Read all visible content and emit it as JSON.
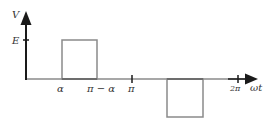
{
  "diagram": {
    "type": "waveform",
    "axes": {
      "y_label": "V",
      "x_label": "ωt",
      "y_tick_label": "E",
      "x_tick_labels": [
        "α",
        "π − α",
        "π",
        "2π"
      ]
    },
    "pulses": [
      {
        "name": "positive-pulse",
        "from": "α",
        "to": "π − α",
        "level": "E"
      },
      {
        "name": "negative-pulse",
        "from": "π + α",
        "to": "2π − α",
        "level": "−E"
      }
    ],
    "colors": {
      "axis": "#1a1a1a",
      "pulse_outline": "#8a8a8a",
      "text": "#333333"
    }
  }
}
